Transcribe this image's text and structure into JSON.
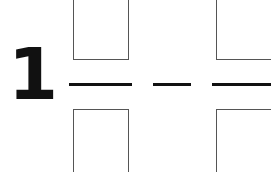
{
  "problem": {
    "number": "1",
    "operator": "minus",
    "fractions": [
      {
        "numerator_box": "",
        "denominator_box": ""
      },
      {
        "numerator_box": "",
        "denominator_box": ""
      }
    ]
  }
}
